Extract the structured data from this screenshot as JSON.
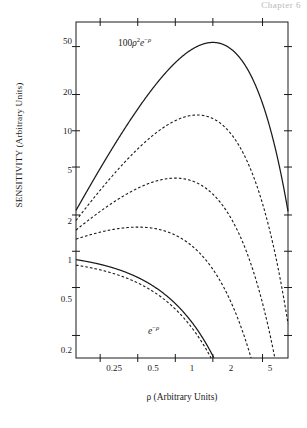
{
  "page": {
    "header_fragment": "Chapter 6"
  },
  "chart_data": {
    "type": "line",
    "title": "",
    "xlabel": "ρ (Arbitrary Units)",
    "ylabel": "SENSITIVITY (Arbitrary Units)",
    "xscale": "log",
    "yscale": "log",
    "xlim": [
      0.16,
      8.0
    ],
    "ylim": [
      0.13,
      80
    ],
    "grid": false,
    "legend": "none",
    "xticks": [
      0.25,
      0.5,
      1,
      2,
      5
    ],
    "xticklabels": [
      "0.25",
      "0.5",
      "1",
      "2",
      "5"
    ],
    "yticks": [
      0.2,
      0.5,
      1,
      2,
      5,
      10,
      20,
      50
    ],
    "yticklabels": [
      "0.2",
      "0.5",
      "1",
      "2",
      "5",
      "10",
      "20",
      "50"
    ],
    "annotations": [
      {
        "text": "100ρ²e⁻ρ",
        "x": 0.78,
        "y": 46,
        "style": "solid-upper-label"
      },
      {
        "text": "e⁻ρ",
        "x": 1.25,
        "y": 0.24,
        "style": "solid-lower-label"
      }
    ],
    "series": [
      {
        "name": "100ρ²e⁻ρ",
        "style": "solid",
        "exponent": 2,
        "scale": 100,
        "peak_x": 2.0,
        "peak_y": 55,
        "x": [
          0.17,
          0.25,
          0.35,
          0.5,
          0.7,
          1.0,
          1.4,
          2.0,
          2.8,
          4.0,
          5.0,
          6.0,
          7.0
        ],
        "y": [
          1.95,
          4.9,
          8.6,
          15.2,
          24.3,
          36.8,
          48.4,
          54.1,
          47.7,
          29.3,
          16.8,
          8.9,
          6.4
        ]
      },
      {
        "name": "33ρ^1.5e⁻ρ",
        "style": "dashed",
        "exponent": 1.5,
        "scale": 33,
        "peak_x": 1.9,
        "peak_y": 19,
        "x": [
          0.17,
          0.25,
          0.35,
          0.5,
          0.7,
          1.0,
          1.4,
          2.0,
          2.8,
          4.0,
          5.0,
          6.0,
          7.0
        ],
        "y": [
          1.5,
          3.2,
          5.1,
          7.9,
          11.1,
          14.6,
          17.9,
          19.0,
          16.0,
          9.5,
          5.3,
          2.8,
          1.5
        ]
      },
      {
        "name": "11ρe⁻ρ",
        "style": "dashed",
        "exponent": 1.0,
        "scale": 11,
        "peak_x": 1.85,
        "peak_y": 6.0,
        "x": [
          0.17,
          0.25,
          0.35,
          0.5,
          0.7,
          1.0,
          1.4,
          2.0,
          2.8,
          4.0,
          5.0,
          6.0,
          7.0
        ],
        "y": [
          1.12,
          1.65,
          2.25,
          3.05,
          3.95,
          4.9,
          5.7,
          6.0,
          5.05,
          2.95,
          1.55,
          0.78,
          0.4
        ]
      },
      {
        "name": "3.7ρ^0.5e⁻ρ",
        "style": "dashed",
        "exponent": 0.5,
        "scale": 3.7,
        "peak_x": 1.8,
        "peak_y": 2.0,
        "x": [
          0.17,
          0.25,
          0.35,
          0.5,
          0.7,
          1.0,
          1.4,
          2.0,
          2.8,
          4.0,
          5.0,
          6.0,
          7.0
        ],
        "y": [
          0.88,
          0.98,
          1.12,
          1.32,
          1.55,
          1.78,
          1.96,
          2.0,
          1.65,
          0.92,
          0.46,
          0.22,
          0.11
        ]
      },
      {
        "name": "0.9e⁻ρ (flat)",
        "style": "dashed",
        "exponent": 0.0,
        "scale": 0.9,
        "peak_x": 1.7,
        "peak_y": 0.82,
        "x": [
          0.17,
          0.25,
          0.35,
          0.5,
          0.7,
          1.0,
          1.4,
          2.0,
          2.8,
          4.0,
          5.0,
          6.0,
          7.0
        ],
        "y": [
          0.8,
          0.8,
          0.8,
          0.8,
          0.81,
          0.82,
          0.82,
          0.8,
          0.68,
          0.4,
          0.22,
          0.12,
          0.065
        ]
      },
      {
        "name": "e⁻ρ",
        "style": "solid",
        "exponent": -1,
        "scale": 1,
        "x": [
          0.17,
          0.25,
          0.35,
          0.5,
          0.7,
          1.0,
          1.4,
          1.8,
          2.1,
          2.3
        ],
        "y": [
          0.84,
          0.78,
          0.705,
          0.607,
          0.497,
          0.368,
          0.247,
          0.165,
          0.122,
          0.1
        ]
      }
    ]
  },
  "axis": {
    "frame_color": "#1a1a1a"
  }
}
